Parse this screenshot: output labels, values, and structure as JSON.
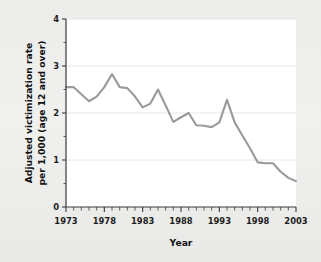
{
  "chart_data": {
    "type": "line",
    "title": "",
    "xlabel": "Year",
    "ylabel": "Adjusted victimization rate per 1,000 (age 12 and over)",
    "ylabel_line1": "Adjusted victimization rate",
    "ylabel_line2": "per 1,000 (age 12 and over)",
    "xlim": [
      1973,
      2003
    ],
    "ylim": [
      0,
      4
    ],
    "grid": true,
    "legend": "none",
    "line_color": "#9a9a9a",
    "plot_background": "#ffffff",
    "figure_background": "#eeeeec",
    "y_ticks": [
      0,
      1,
      2,
      3,
      4
    ],
    "y_tick_labels": [
      "0",
      "1",
      "2",
      "3",
      "4"
    ],
    "y_minor_ticks": [
      0.5,
      1.5,
      2.5,
      3.5
    ],
    "x_ticks": [
      1973,
      1978,
      1983,
      1988,
      1993,
      1998,
      2003
    ],
    "x_tick_labels": [
      "1973",
      "1978",
      "1983",
      "1988",
      "1993",
      "1998",
      "2003"
    ],
    "x_minor_tick_interval": 1,
    "x": [
      1973,
      1974,
      1975,
      1976,
      1977,
      1978,
      1979,
      1980,
      1981,
      1982,
      1983,
      1984,
      1985,
      1986,
      1987,
      1988,
      1989,
      1990,
      1991,
      1992,
      1993,
      1994,
      1995,
      1996,
      1997,
      1998,
      1999,
      2000,
      2001,
      2002,
      2003
    ],
    "values": [
      2.55,
      2.55,
      2.4,
      2.25,
      2.35,
      2.55,
      2.83,
      2.55,
      2.53,
      2.35,
      2.12,
      2.2,
      2.5,
      2.16,
      1.81,
      1.91,
      2.0,
      1.74,
      1.73,
      1.7,
      1.8,
      2.28,
      1.8,
      1.52,
      1.25,
      0.95,
      0.93,
      0.93,
      0.75,
      0.62,
      0.55
    ],
    "series_name": "Adjusted victimization rate"
  },
  "axis": {
    "x_title": "Year",
    "y_title_line1": "Adjusted victimization rate",
    "y_title_line2": "per 1,000 (age 12 and over)"
  }
}
